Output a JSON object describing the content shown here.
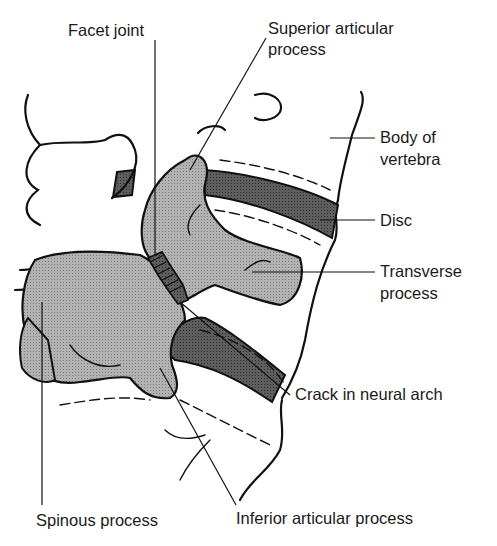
{
  "diagram": {
    "labels": {
      "facet_joint": "Facet joint",
      "superior_articular_process_l1": "Superior articular",
      "superior_articular_process_l2": "process",
      "body_of_vertebra_l1": "Body of",
      "body_of_vertebra_l2": "vertebra",
      "disc": "Disc",
      "transverse_process_l1": "Transverse",
      "transverse_process_l2": "process",
      "crack_in_neural_arch": "Crack in neural arch",
      "spinous_process": "Spinous process",
      "inferior_articular_process": "Inferior articular process"
    },
    "colors": {
      "bone_fill": "#a9a9a9",
      "disc_fill": "#5a5a5a",
      "crack_fill": "#3d3d3d",
      "outline": "#111111",
      "background": "#ffffff"
    }
  }
}
